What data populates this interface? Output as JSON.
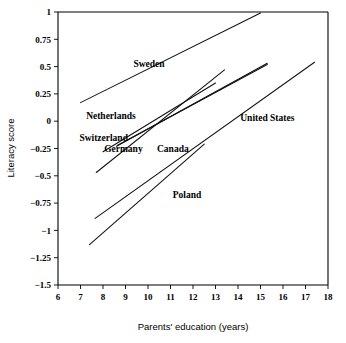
{
  "figure": {
    "title": "",
    "background": "#ffffff",
    "line_color": "#111111"
  },
  "axes": {
    "x": {
      "label": "Parents' education (years)",
      "min": 6,
      "max": 18,
      "ticks": [
        "6",
        "7",
        "8",
        "9",
        "10",
        "11",
        "12",
        "13",
        "14",
        "15",
        "16",
        "17",
        "18"
      ],
      "tick_values": [
        6,
        7,
        8,
        9,
        10,
        11,
        12,
        13,
        14,
        15,
        16,
        17,
        18
      ]
    },
    "y": {
      "label": "Literacy score",
      "min": -1.5,
      "max": 1,
      "ticks": [
        "1",
        "0.75",
        "0.5",
        "0.25",
        "0",
        "−0.25",
        "−0.5",
        "−0.75",
        "−1",
        "−1.25",
        "−1.5"
      ],
      "tick_values": [
        1,
        0.75,
        0.5,
        0.25,
        0,
        -0.25,
        -0.5,
        -0.75,
        -1,
        -1.25,
        -1.5
      ]
    }
  },
  "chart_data": {
    "type": "line",
    "title": "",
    "xlabel": "Parents' education (years)",
    "ylabel": "Literacy score",
    "xlim": [
      6,
      18
    ],
    "ylim": [
      -1.5,
      1
    ],
    "grid": false,
    "legend": "inline-labels",
    "series": [
      {
        "name": "Sweden",
        "x": [
          7.0,
          15.0
        ],
        "y": [
          0.17,
          0.99
        ],
        "label_x": 9.35,
        "label_y": 0.5
      },
      {
        "name": "Netherlands",
        "x": [
          7.7,
          13.4
        ],
        "y": [
          -0.47,
          0.47
        ],
        "label_x": 7.25,
        "label_y": 0.02
      },
      {
        "name": "Switzerland",
        "x": [
          8.0,
          13.0
        ],
        "y": [
          -0.28,
          0.35
        ],
        "label_x": 6.95,
        "label_y": -0.18
      },
      {
        "name": "Germany",
        "x": [
          8.6,
          15.3
        ],
        "y": [
          -0.23,
          0.53
        ],
        "label_x": 8.05,
        "label_y": -0.28
      },
      {
        "name": "Canada",
        "x": [
          8.65,
          15.3
        ],
        "y": [
          -0.22,
          0.52
        ],
        "label_x": 10.4,
        "label_y": -0.28
      },
      {
        "name": "United States",
        "x": [
          7.65,
          17.4
        ],
        "y": [
          -0.89,
          0.54
        ],
        "label_x": 14.1,
        "label_y": 0.0
      },
      {
        "name": "Poland",
        "x": [
          7.4,
          12.5
        ],
        "y": [
          -1.13,
          -0.21
        ],
        "label_x": 11.1,
        "label_y": -0.7
      }
    ]
  }
}
